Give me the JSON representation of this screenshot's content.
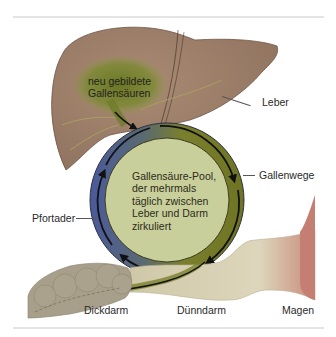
{
  "diagram": {
    "labels": {
      "new_bile_acids": [
        "neu gebildete",
        "Gallensäuren"
      ],
      "liver": "Leber",
      "bile_ducts": "Gallenwege",
      "portal_vein": "Pfortader",
      "pool": [
        "Gallensäure-Pool,",
        "der mehrmals",
        "täglich zwischen",
        "Leber und Darm",
        "zirkuliert"
      ],
      "large_intestine": "Dickdarm",
      "small_intestine": "Dünndarm",
      "stomach": "Magen"
    },
    "colors": {
      "liver": "#9c7e6a",
      "new_bile_acid_patch": "#6f7d2a",
      "pool_fill": "#c9cf9a",
      "ring_bile": "#7a7f2c",
      "ring_portal": "#4a5a9a",
      "arrows": "#111111",
      "large_intestine": "#a79f8a",
      "small_intestine": "#d8d2b6",
      "stomach": "#c47f72"
    }
  }
}
